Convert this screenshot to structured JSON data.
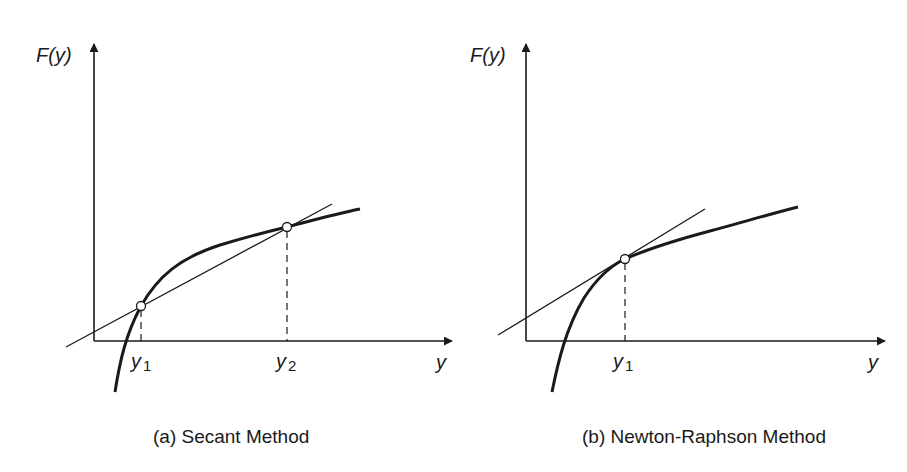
{
  "panels": [
    {
      "id": "a",
      "caption": "(a) Secant Method",
      "y_axis_label": "F(y)",
      "x_axis_label": "y",
      "points": [
        {
          "label_main": "y",
          "label_sub": "1"
        },
        {
          "label_main": "y",
          "label_sub": "2"
        }
      ],
      "line_type": "secant"
    },
    {
      "id": "b",
      "caption": "(b) Newton-Raphson Method",
      "y_axis_label": "F(y)",
      "x_axis_label": "y",
      "points": [
        {
          "label_main": "y",
          "label_sub": "1"
        }
      ],
      "line_type": "tangent"
    }
  ],
  "colors": {
    "ink": "#1a1a1a",
    "background": "#ffffff"
  }
}
